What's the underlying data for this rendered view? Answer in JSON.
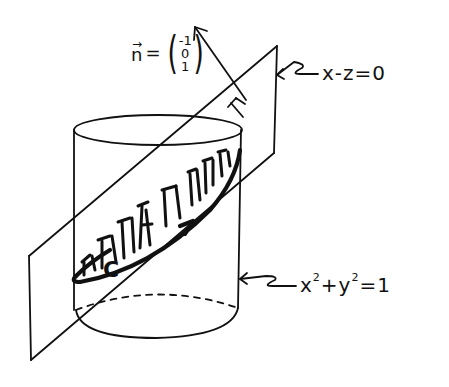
{
  "diagram": {
    "title": "",
    "style": "hand-drawn sketch",
    "colors": {
      "ink": "#111111",
      "background": "#ffffff"
    },
    "labels": {
      "normal_vector": {
        "symbol": "n",
        "arrow": "→",
        "equals": "=",
        "components": [
          "-1",
          "0",
          "1"
        ]
      },
      "plane_equation": "x-z=0",
      "cylinder_equation_base_x": "x",
      "cylinder_equation_exp_x": "2",
      "cylinder_equation_plus": "+",
      "cylinder_equation_base_y": "y",
      "cylinder_equation_exp_y": "2",
      "cylinder_equation_rhs": "=1",
      "curve": "C"
    },
    "elements": [
      {
        "name": "cylinder",
        "equation": "x^2+y^2=1"
      },
      {
        "name": "plane",
        "equation": "x-z=0"
      },
      {
        "name": "normal-vector",
        "value": [
          -1,
          0,
          1
        ]
      },
      {
        "name": "curve-C",
        "description": "intersection of plane and cylinder, oriented with arrow"
      },
      {
        "name": "hatched-surface",
        "description": "elliptical region of plane inside cylinder"
      },
      {
        "name": "right-angle-mark"
      }
    ]
  }
}
